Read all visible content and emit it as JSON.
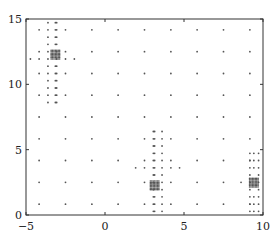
{
  "chart_data": {
    "type": "scatter",
    "title": "",
    "xlabel": "",
    "ylabel": "",
    "xlim": [
      -5,
      10
    ],
    "ylim": [
      0,
      15
    ],
    "xticks": [
      -5,
      0,
      5,
      10
    ],
    "yticks": [
      0,
      5,
      10,
      15
    ],
    "xtick_labels": [
      "−5",
      "0",
      "5",
      "10"
    ],
    "ytick_labels": [
      "0",
      "5",
      "10",
      "15"
    ],
    "grid": false,
    "legend": null,
    "marker": "small-dot",
    "marker_color": "#555555",
    "base_grid": {
      "x": [
        -4.17,
        -2.5,
        -0.83,
        0.83,
        2.5,
        4.17,
        5.83,
        7.5,
        9.17
      ],
      "y": [
        0.83,
        2.5,
        4.17,
        5.83,
        7.5,
        9.17,
        10.83,
        12.5,
        14.17
      ]
    },
    "refinement_clusters": [
      {
        "center": [
          -3.14,
          12.27
        ],
        "x": [
          -4.72,
          -4.17,
          -3.61,
          -3.06,
          -2.5,
          -1.94
        ],
        "y": [
          8.61,
          9.17,
          9.72,
          10.28,
          10.83,
          11.39,
          11.94,
          12.5,
          13.06,
          13.61,
          14.17,
          14.72
        ]
      },
      {
        "center": [
          3.14,
          2.27
        ],
        "x": [
          1.94,
          2.5,
          3.06,
          3.61,
          4.17,
          4.72
        ],
        "y": [
          0.28,
          0.83,
          1.39,
          1.94,
          2.5,
          3.06,
          3.61,
          4.17,
          4.72,
          5.28,
          5.83,
          6.39
        ]
      },
      {
        "center": [
          9.42,
          2.47
        ],
        "x": [
          8.61,
          9.17,
          9.72
        ],
        "y": [
          0.28,
          0.83,
          1.39,
          1.94,
          2.5,
          3.06,
          3.61,
          4.17,
          4.72
        ]
      }
    ]
  }
}
